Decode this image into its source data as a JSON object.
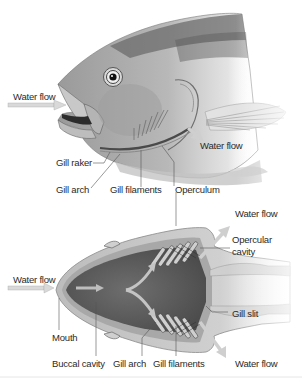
{
  "figure": {
    "top_panel": {
      "description": "Lateral view of fish head showing gill structures",
      "labels": {
        "water_flow_in": "Water flow",
        "water_flow_out": "Water flow",
        "gill_raker": "Gill raker",
        "gill_arch": "Gill arch",
        "gill_filaments": "Gill filaments",
        "operculum": "Operculum"
      }
    },
    "bottom_panel": {
      "description": "Ventral/dorsal section of fish head showing water path through gills",
      "labels": {
        "water_flow_in": "Water flow",
        "water_flow_out_top": "Water flow",
        "water_flow_out_bottom": "Water flow",
        "opercular_cavity": "Opercular cavity",
        "opercular_cavity_line1": "Opercular",
        "opercular_cavity_line2": "cavity",
        "gill_slit": "Gill slit",
        "mouth": "Mouth",
        "buccal_cavity": "Buccal cavity",
        "gill_arch": "Gill arch",
        "gill_filaments": "Gill filaments"
      }
    },
    "colors": {
      "background": "#ffffff",
      "label_text": "#2a2a2a",
      "leader_line": "#555555",
      "arrow_fill": "#d9d9d9",
      "body_dark": "#4a4a4a",
      "body_mid": "#8c8c8c",
      "body_light": "#d6d6d6"
    }
  }
}
